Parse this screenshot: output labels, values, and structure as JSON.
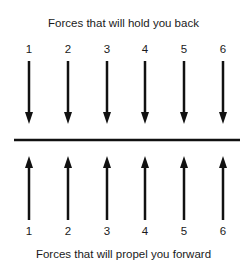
{
  "top_title": "Forces that will hold you back",
  "bottom_title": "Forces that will propel you forward",
  "top_numbers": [
    "1",
    "2",
    "3",
    "4",
    "5",
    "6"
  ],
  "bottom_numbers": [
    "1",
    "2",
    "3",
    "4",
    "5",
    "6"
  ],
  "arrow_color": "#111111"
}
